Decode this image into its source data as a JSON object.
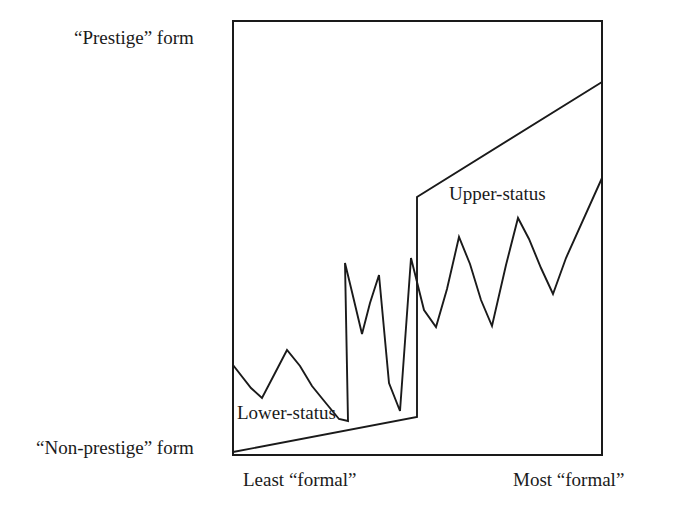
{
  "figure": {
    "background": "#ffffff",
    "line_color": "#1a1a1a",
    "axis_color": "#1a1a1a"
  },
  "labels": {
    "y_top": "“Prestige” form",
    "y_bottom": "“Non-prestige” form",
    "x_left": "Least “formal”",
    "x_right": "Most “formal”",
    "series_lower": "Lower-status",
    "series_upper": "Upper-status"
  },
  "chart_data": {
    "type": "line",
    "title": "",
    "xlabel": "Formality of speech style",
    "ylabel": "Use of prestige vs. non-prestige form",
    "xlim": [
      0,
      1
    ],
    "ylim": [
      0,
      1
    ],
    "grid": false,
    "legend_position": "inline-annotations",
    "axis_tick_labels": {
      "x": [
        "Least “formal”",
        "Most “formal”"
      ],
      "y": [
        "“Non-prestige” form",
        "“Prestige” form"
      ]
    },
    "annotations": [
      {
        "text": "Lower-status",
        "x": 0.012,
        "y": 0.125
      },
      {
        "text": "Upper-status",
        "x": 0.585,
        "y": 0.635
      }
    ],
    "series": [
      {
        "name": "Upper-status",
        "description": "Smooth two-segment trend line: gentle rise across lower-status range, vertical step up, then steady rise to top right",
        "x": [
          0.0,
          0.499,
          0.499,
          1.0
        ],
        "y": [
          0.007,
          0.088,
          0.595,
          0.86
        ]
      },
      {
        "name": "Lower-status",
        "description": "Jagged zig-zag line rising from lower left to upper right with sharp peaks and valleys",
        "x": [
          0.0,
          0.049,
          0.078,
          0.111,
          0.146,
          0.182,
          0.214,
          0.247,
          0.285,
          0.309,
          0.333,
          0.355,
          0.384,
          0.412,
          0.434,
          0.463,
          0.491,
          0.522,
          0.556,
          0.588,
          0.62,
          0.653,
          0.685,
          0.718,
          0.748,
          0.786,
          0.818,
          0.847,
          0.878,
          0.911,
          0.944,
          1.0
        ],
        "y": [
          0.207,
          0.155,
          0.131,
          0.183,
          0.241,
          0.205,
          0.158,
          0.12,
          0.081,
          0.076,
          0.442,
          0.375,
          0.277,
          0.348,
          0.412,
          0.16,
          0.095,
          0.446,
          0.33,
          0.29,
          0.38,
          0.5,
          0.437,
          0.355,
          0.296,
          0.436,
          0.545,
          0.497,
          0.431,
          0.372,
          0.455,
          0.638
        ]
      }
    ],
    "geometry_px": {
      "plot_box": {
        "left": 233,
        "top": 21,
        "right": 602,
        "bottom": 455
      },
      "smooth_line_points": "233,452 417,417 417,197 602,82",
      "zigzag_points": "233,365 251,388 262,398 274,375 287,350 300,366 312,386 325,402 339,419 348,421 345,263 352,292 362,334 370,303 379,275 389,383 400,411 411,258 424,310 436,327 447,289 459,237 470,264 481,300 492,326 506,265 518,218 529,239 541,268 553,294 566,258 602,178"
    }
  }
}
